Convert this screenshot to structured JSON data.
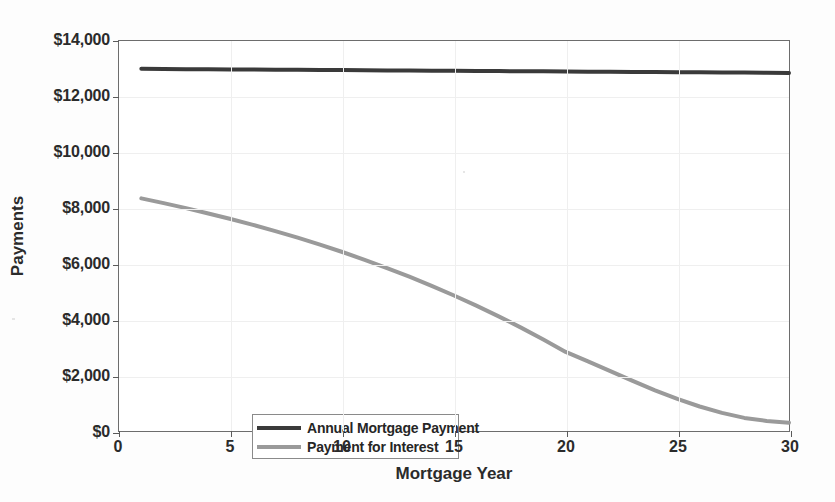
{
  "chart_data": {
    "type": "line",
    "title": "",
    "xlabel": "Mortgage Year",
    "ylabel": "Payments",
    "xlim": [
      0,
      30
    ],
    "ylim": [
      0,
      14000
    ],
    "grid": true,
    "legend_position": "bottom-left",
    "xticks": [
      0,
      5,
      10,
      15,
      20,
      25,
      30
    ],
    "xtick_labels": [
      "0",
      "5",
      "10",
      "15",
      "20",
      "25",
      "30"
    ],
    "yticks": [
      0,
      2000,
      4000,
      6000,
      8000,
      10000,
      12000,
      14000
    ],
    "ytick_labels": [
      "$0",
      "$2,000",
      "$4,000",
      "$6,000",
      "$8,000",
      "$10,000",
      "$12,000",
      "$14,000"
    ],
    "x": [
      1,
      2,
      3,
      4,
      5,
      6,
      7,
      8,
      9,
      10,
      11,
      12,
      13,
      14,
      15,
      16,
      17,
      18,
      19,
      20,
      21,
      22,
      23,
      24,
      25,
      26,
      27,
      28,
      29,
      30
    ],
    "series": [
      {
        "name": "Annual Mortgage Payment",
        "color": "#3a3a3a",
        "width": 4,
        "values": [
          13000,
          12995,
          12990,
          12985,
          12980,
          12975,
          12970,
          12965,
          12960,
          12955,
          12950,
          12945,
          12940,
          12935,
          12930,
          12925,
          12920,
          12915,
          12910,
          12905,
          12900,
          12895,
          12890,
          12885,
          12880,
          12875,
          12870,
          12865,
          12860,
          12855
        ]
      },
      {
        "name": "Payment for Interest",
        "color": "#9a9a9a",
        "width": 4,
        "values": [
          8350,
          8180,
          8000,
          7810,
          7610,
          7400,
          7175,
          6940,
          6690,
          6425,
          6145,
          5850,
          5540,
          5210,
          4865,
          4500,
          4115,
          3710,
          3285,
          2840,
          2500,
          2150,
          1800,
          1460,
          1150,
          880,
          650,
          470,
          360,
          300
        ]
      }
    ]
  },
  "legend": {
    "entries": [
      {
        "label": "Annual Mortgage Payment",
        "color": "#3a3a3a"
      },
      {
        "label": "Payment for Interest",
        "color": "#9a9a9a"
      }
    ]
  },
  "colors": {
    "background": "#ffffff",
    "axis": "#6d6d6d",
    "grid": "#efefef",
    "text": "#2b2b2b",
    "series_primary": "#3a3a3a",
    "series_secondary": "#9a9a9a"
  }
}
